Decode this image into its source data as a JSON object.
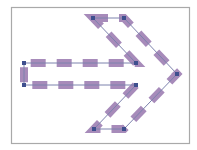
{
  "diagram": {
    "type": "arrow-shape-with-dashed-outline",
    "frame": {
      "x": 11,
      "y": 7,
      "width": 178,
      "height": 136,
      "stroke": "#a9a9a9",
      "fill": "#ffffff"
    },
    "path": {
      "vertices": [
        [
          93,
          18
        ],
        [
          124,
          18
        ],
        [
          177,
          74
        ],
        [
          124,
          129
        ],
        [
          94,
          129
        ],
        [
          136,
          85
        ],
        [
          24,
          85
        ],
        [
          24,
          63
        ],
        [
          136,
          63
        ]
      ],
      "line_color": "#7c82ad",
      "dash_color": "#8e6aa6",
      "dash_opacity": 0.78,
      "dash_width": 8,
      "dash_length": 15,
      "gap_length": 11
    },
    "handle_color": "#3e4f8e",
    "handle_size": 4
  }
}
